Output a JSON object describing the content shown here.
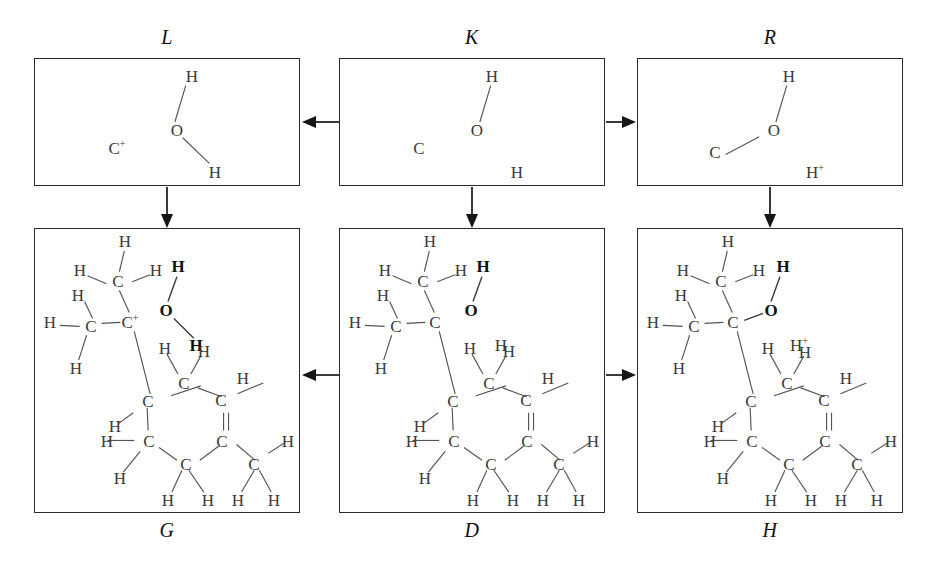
{
  "figure": {
    "type": "diagram",
    "grid": {
      "rows": 2,
      "cols": 3
    }
  },
  "panels": [
    {
      "id": "L",
      "label": "L",
      "label_position": "top",
      "box": {
        "x": 34,
        "y": 58,
        "w": 266,
        "h": 128
      },
      "molecule": "water-fragment-carbocation",
      "atoms": [
        {
          "symbol": "H",
          "charge": "",
          "bold": false,
          "x": 192,
          "y": 76
        },
        {
          "symbol": "O",
          "charge": "",
          "bold": false,
          "x": 177,
          "y": 130
        },
        {
          "symbol": "H",
          "charge": "",
          "bold": false,
          "x": 215,
          "y": 172
        },
        {
          "symbol": "C",
          "charge": "+",
          "bold": false,
          "x": 117,
          "y": 148
        }
      ],
      "bonds": [
        {
          "from": 0,
          "to": 1,
          "order": 1
        },
        {
          "from": 1,
          "to": 2,
          "order": 1
        }
      ]
    },
    {
      "id": "K",
      "label": "K",
      "label_position": "top",
      "box": {
        "x": 339,
        "y": 58,
        "w": 266,
        "h": 128
      },
      "molecule": "fully-dissociated-fragments",
      "atoms": [
        {
          "symbol": "H",
          "charge": "",
          "bold": false,
          "x": 492,
          "y": 76
        },
        {
          "symbol": "O",
          "charge": "",
          "bold": false,
          "x": 477,
          "y": 130
        },
        {
          "symbol": "H",
          "charge": "",
          "bold": false,
          "x": 517,
          "y": 172
        },
        {
          "symbol": "C",
          "charge": "",
          "bold": false,
          "x": 419,
          "y": 148
        }
      ],
      "bonds": [
        {
          "from": 0,
          "to": 1,
          "order": 1
        }
      ]
    },
    {
      "id": "R",
      "label": "R",
      "label_position": "top",
      "box": {
        "x": 637,
        "y": 58,
        "w": 266,
        "h": 128
      },
      "molecule": "alcohol-fragment-proton",
      "atoms": [
        {
          "symbol": "H",
          "charge": "",
          "bold": false,
          "x": 789,
          "y": 76
        },
        {
          "symbol": "O",
          "charge": "",
          "bold": false,
          "x": 774,
          "y": 130
        },
        {
          "symbol": "H",
          "charge": "+",
          "bold": false,
          "x": 815,
          "y": 172
        },
        {
          "symbol": "C",
          "charge": "",
          "bold": false,
          "x": 715,
          "y": 152
        }
      ],
      "bonds": [
        {
          "from": 0,
          "to": 1,
          "order": 1
        },
        {
          "from": 3,
          "to": 1,
          "order": 1
        }
      ]
    },
    {
      "id": "G",
      "label": "G",
      "label_position": "bottom",
      "box": {
        "x": 34,
        "y": 228,
        "w": 266,
        "h": 285
      },
      "molecule": "full-carbocation-with-water",
      "atoms": [
        {
          "symbol": "H",
          "charge": "",
          "bold": false,
          "x": 125,
          "y": 241
        },
        {
          "symbol": "H",
          "charge": "",
          "bold": false,
          "x": 80,
          "y": 270
        },
        {
          "symbol": "C",
          "charge": "",
          "bold": false,
          "x": 118,
          "y": 281
        },
        {
          "symbol": "H",
          "charge": "",
          "bold": false,
          "x": 156,
          "y": 270
        },
        {
          "symbol": "H",
          "charge": "",
          "bold": false,
          "x": 78,
          "y": 295
        },
        {
          "symbol": "H",
          "charge": "",
          "bold": false,
          "x": 50,
          "y": 322
        },
        {
          "symbol": "C",
          "charge": "",
          "bold": false,
          "x": 91,
          "y": 326
        },
        {
          "symbol": "H",
          "charge": "",
          "bold": false,
          "x": 76,
          "y": 368
        },
        {
          "symbol": "C",
          "charge": "+",
          "bold": false,
          "x": 130,
          "y": 322
        },
        {
          "symbol": "H",
          "charge": "",
          "bold": true,
          "x": 178,
          "y": 266
        },
        {
          "symbol": "O",
          "charge": "",
          "bold": true,
          "x": 166,
          "y": 310
        },
        {
          "symbol": "H",
          "charge": "",
          "bold": true,
          "x": 196,
          "y": 345
        },
        {
          "symbol": "H",
          "charge": "",
          "bold": false,
          "x": 204,
          "y": 351
        },
        {
          "symbol": "H",
          "charge": "",
          "bold": false,
          "x": 165,
          "y": 348
        },
        {
          "symbol": "C",
          "charge": "",
          "bold": false,
          "x": 184,
          "y": 383
        },
        {
          "symbol": "H",
          "charge": "",
          "bold": false,
          "x": 243,
          "y": 378
        },
        {
          "symbol": "C",
          "charge": "",
          "bold": false,
          "x": 221,
          "y": 400
        },
        {
          "symbol": "C",
          "charge": "",
          "bold": false,
          "x": 148,
          "y": 401
        },
        {
          "symbol": "H",
          "charge": "",
          "bold": false,
          "x": 115,
          "y": 426
        },
        {
          "symbol": "C",
          "charge": "",
          "bold": false,
          "x": 149,
          "y": 441
        },
        {
          "symbol": "H",
          "charge": "",
          "bold": false,
          "x": 107,
          "y": 441
        },
        {
          "symbol": "H",
          "charge": "",
          "bold": false,
          "x": 120,
          "y": 478
        },
        {
          "symbol": "C",
          "charge": "",
          "bold": false,
          "x": 186,
          "y": 464
        },
        {
          "symbol": "C",
          "charge": "",
          "bold": false,
          "x": 222,
          "y": 441
        },
        {
          "symbol": "C",
          "charge": "",
          "bold": false,
          "x": 254,
          "y": 464
        },
        {
          "symbol": "H",
          "charge": "",
          "bold": false,
          "x": 288,
          "y": 441
        },
        {
          "symbol": "H",
          "charge": "",
          "bold": false,
          "x": 168,
          "y": 500
        },
        {
          "symbol": "H",
          "charge": "",
          "bold": false,
          "x": 208,
          "y": 500
        },
        {
          "symbol": "H",
          "charge": "",
          "bold": false,
          "x": 238,
          "y": 500
        },
        {
          "symbol": "H",
          "charge": "",
          "bold": false,
          "x": 274,
          "y": 500
        }
      ]
    },
    {
      "id": "D",
      "label": "D",
      "label_position": "bottom",
      "box": {
        "x": 339,
        "y": 228,
        "w": 266,
        "h": 285
      },
      "molecule": "neutral-dissociated",
      "atoms": [
        {
          "symbol": "H",
          "charge": "",
          "bold": false,
          "x": 430,
          "y": 241
        },
        {
          "symbol": "H",
          "charge": "",
          "bold": false,
          "x": 385,
          "y": 270
        },
        {
          "symbol": "C",
          "charge": "",
          "bold": false,
          "x": 423,
          "y": 281
        },
        {
          "symbol": "H",
          "charge": "",
          "bold": false,
          "x": 461,
          "y": 270
        },
        {
          "symbol": "H",
          "charge": "",
          "bold": false,
          "x": 383,
          "y": 295
        },
        {
          "symbol": "H",
          "charge": "",
          "bold": false,
          "x": 355,
          "y": 322
        },
        {
          "symbol": "C",
          "charge": "",
          "bold": false,
          "x": 396,
          "y": 326
        },
        {
          "symbol": "H",
          "charge": "",
          "bold": false,
          "x": 381,
          "y": 368
        },
        {
          "symbol": "C",
          "charge": "",
          "bold": false,
          "x": 435,
          "y": 322
        },
        {
          "symbol": "H",
          "charge": "",
          "bold": true,
          "x": 483,
          "y": 266
        },
        {
          "symbol": "O",
          "charge": "",
          "bold": true,
          "x": 471,
          "y": 310
        },
        {
          "symbol": "H",
          "charge": "",
          "bold": false,
          "x": 501,
          "y": 345
        },
        {
          "symbol": "H",
          "charge": "",
          "bold": false,
          "x": 509,
          "y": 351
        },
        {
          "symbol": "H",
          "charge": "",
          "bold": false,
          "x": 470,
          "y": 348
        },
        {
          "symbol": "C",
          "charge": "",
          "bold": false,
          "x": 489,
          "y": 383
        },
        {
          "symbol": "H",
          "charge": "",
          "bold": false,
          "x": 548,
          "y": 378
        },
        {
          "symbol": "C",
          "charge": "",
          "bold": false,
          "x": 526,
          "y": 400
        },
        {
          "symbol": "C",
          "charge": "",
          "bold": false,
          "x": 453,
          "y": 401
        },
        {
          "symbol": "H",
          "charge": "",
          "bold": false,
          "x": 420,
          "y": 426
        },
        {
          "symbol": "C",
          "charge": "",
          "bold": false,
          "x": 454,
          "y": 441
        },
        {
          "symbol": "H",
          "charge": "",
          "bold": false,
          "x": 412,
          "y": 441
        },
        {
          "symbol": "H",
          "charge": "",
          "bold": false,
          "x": 425,
          "y": 478
        },
        {
          "symbol": "C",
          "charge": "",
          "bold": false,
          "x": 491,
          "y": 464
        },
        {
          "symbol": "C",
          "charge": "",
          "bold": false,
          "x": 527,
          "y": 441
        },
        {
          "symbol": "C",
          "charge": "",
          "bold": false,
          "x": 559,
          "y": 464
        },
        {
          "symbol": "H",
          "charge": "",
          "bold": false,
          "x": 593,
          "y": 441
        },
        {
          "symbol": "H",
          "charge": "",
          "bold": false,
          "x": 473,
          "y": 500
        },
        {
          "symbol": "H",
          "charge": "",
          "bold": false,
          "x": 513,
          "y": 500
        },
        {
          "symbol": "H",
          "charge": "",
          "bold": false,
          "x": 543,
          "y": 500
        },
        {
          "symbol": "H",
          "charge": "",
          "bold": false,
          "x": 579,
          "y": 500
        }
      ]
    },
    {
      "id": "H",
      "label": "H",
      "label_position": "bottom",
      "box": {
        "x": 637,
        "y": 228,
        "w": 266,
        "h": 285
      },
      "molecule": "alcohol-with-proton",
      "atoms": [
        {
          "symbol": "H",
          "charge": "",
          "bold": false,
          "x": 728,
          "y": 241
        },
        {
          "symbol": "H",
          "charge": "",
          "bold": false,
          "x": 683,
          "y": 270
        },
        {
          "symbol": "C",
          "charge": "",
          "bold": false,
          "x": 721,
          "y": 281
        },
        {
          "symbol": "H",
          "charge": "",
          "bold": false,
          "x": 759,
          "y": 270
        },
        {
          "symbol": "H",
          "charge": "",
          "bold": false,
          "x": 681,
          "y": 295
        },
        {
          "symbol": "H",
          "charge": "",
          "bold": false,
          "x": 653,
          "y": 322
        },
        {
          "symbol": "C",
          "charge": "",
          "bold": false,
          "x": 694,
          "y": 326
        },
        {
          "symbol": "H",
          "charge": "",
          "bold": false,
          "x": 679,
          "y": 368
        },
        {
          "symbol": "C",
          "charge": "",
          "bold": false,
          "x": 733,
          "y": 322
        },
        {
          "symbol": "H",
          "charge": "",
          "bold": true,
          "x": 783,
          "y": 266
        },
        {
          "symbol": "O",
          "charge": "",
          "bold": true,
          "x": 771,
          "y": 310
        },
        {
          "symbol": "H",
          "charge": "+",
          "bold": false,
          "x": 799,
          "y": 345
        },
        {
          "symbol": "H",
          "charge": "",
          "bold": false,
          "x": 805,
          "y": 352
        },
        {
          "symbol": "H",
          "charge": "",
          "bold": false,
          "x": 768,
          "y": 348
        },
        {
          "symbol": "C",
          "charge": "",
          "bold": false,
          "x": 787,
          "y": 383
        },
        {
          "symbol": "H",
          "charge": "",
          "bold": false,
          "x": 846,
          "y": 378
        },
        {
          "symbol": "C",
          "charge": "",
          "bold": false,
          "x": 824,
          "y": 400
        },
        {
          "symbol": "C",
          "charge": "",
          "bold": false,
          "x": 751,
          "y": 401
        },
        {
          "symbol": "H",
          "charge": "",
          "bold": false,
          "x": 718,
          "y": 426
        },
        {
          "symbol": "C",
          "charge": "",
          "bold": false,
          "x": 752,
          "y": 441
        },
        {
          "symbol": "H",
          "charge": "",
          "bold": false,
          "x": 710,
          "y": 441
        },
        {
          "symbol": "H",
          "charge": "",
          "bold": false,
          "x": 723,
          "y": 478
        },
        {
          "symbol": "C",
          "charge": "",
          "bold": false,
          "x": 789,
          "y": 464
        },
        {
          "symbol": "C",
          "charge": "",
          "bold": false,
          "x": 825,
          "y": 441
        },
        {
          "symbol": "C",
          "charge": "",
          "bold": false,
          "x": 857,
          "y": 464
        },
        {
          "symbol": "H",
          "charge": "",
          "bold": false,
          "x": 891,
          "y": 441
        },
        {
          "symbol": "H",
          "charge": "",
          "bold": false,
          "x": 771,
          "y": 500
        },
        {
          "symbol": "H",
          "charge": "",
          "bold": false,
          "x": 811,
          "y": 500
        },
        {
          "symbol": "H",
          "charge": "",
          "bold": false,
          "x": 841,
          "y": 500
        },
        {
          "symbol": "H",
          "charge": "",
          "bold": false,
          "x": 877,
          "y": 500
        }
      ]
    }
  ],
  "arrows": [
    {
      "id": "k-to-l",
      "direction": "left",
      "from": "K",
      "to": "L",
      "x1": 339,
      "y1": 122,
      "x2": 302,
      "y2": 122
    },
    {
      "id": "k-to-r",
      "direction": "right",
      "from": "K",
      "to": "R",
      "x1": 606,
      "y1": 122,
      "x2": 636,
      "y2": 122
    },
    {
      "id": "l-to-g",
      "direction": "down",
      "from": "L",
      "to": "G",
      "x1": 167,
      "y1": 187,
      "x2": 167,
      "y2": 227
    },
    {
      "id": "k-to-d",
      "direction": "down",
      "from": "K",
      "to": "D",
      "x1": 472,
      "y1": 187,
      "x2": 472,
      "y2": 227
    },
    {
      "id": "r-to-h",
      "direction": "down",
      "from": "R",
      "to": "H",
      "x1": 770,
      "y1": 187,
      "x2": 770,
      "y2": 227
    },
    {
      "id": "d-to-g",
      "direction": "left",
      "from": "D",
      "to": "G",
      "x1": 339,
      "y1": 375,
      "x2": 302,
      "y2": 375
    },
    {
      "id": "d-to-h",
      "direction": "right",
      "from": "D",
      "to": "H",
      "x1": 606,
      "y1": 375,
      "x2": 636,
      "y2": 375
    }
  ],
  "colors": {
    "box_border": "#2b2b2b",
    "atom_text": "#3a3a3a",
    "atom_text_bold": "#111111",
    "bond_line": "#545454",
    "arrow": "#161616",
    "background": "#ffffff"
  }
}
